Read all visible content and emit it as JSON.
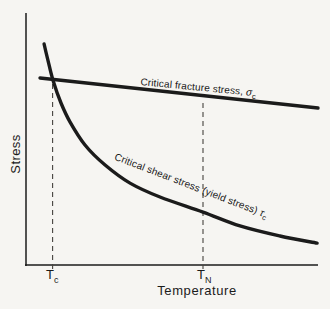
{
  "figure": {
    "background": "#f6f5f2",
    "ink": "#1b1b1b",
    "dash_color": "#45423e"
  },
  "chart_data": {
    "type": "line",
    "title": "",
    "xlabel": "Temperature",
    "ylabel": "Stress",
    "grid": false,
    "legend": "none (series labels drawn along curves)",
    "axes": "schematic, no numeric scale; point coordinates normalized 0-1 within plot box",
    "x_axis": {
      "label": "Temperature",
      "ticks": [
        {
          "main": "T",
          "sub": "c",
          "x": 0.091
        },
        {
          "main": "T",
          "sub": "N",
          "x": 0.606
        }
      ]
    },
    "y_axis": {
      "label": "Stress"
    },
    "series": [
      {
        "name": "Critical fracture stress, σc",
        "shape": "straight",
        "points": [
          [
            0.048,
            0.742
          ],
          [
            1.0,
            0.623
          ]
        ]
      },
      {
        "name": "Critical shear stress (yield stress) τc",
        "shape": "smooth",
        "points": [
          [
            0.062,
            0.877
          ],
          [
            0.075,
            0.813
          ],
          [
            0.092,
            0.734
          ],
          [
            0.12,
            0.643
          ],
          [
            0.151,
            0.567
          ],
          [
            0.202,
            0.476
          ],
          [
            0.271,
            0.397
          ],
          [
            0.356,
            0.325
          ],
          [
            0.459,
            0.27
          ],
          [
            0.606,
            0.21
          ],
          [
            0.733,
            0.155
          ],
          [
            0.87,
            0.115
          ],
          [
            0.997,
            0.087
          ]
        ]
      }
    ],
    "intersection": {
      "x": 0.091,
      "y": 0.734,
      "note": "curves cross at Tc"
    },
    "reference_lines": [
      {
        "label": "Tc",
        "x": 0.091,
        "y_top": 0.718,
        "style": "dashed"
      },
      {
        "label": "TN",
        "x": 0.606,
        "y_top": 0.643,
        "style": "dashed"
      }
    ],
    "annotations": [
      {
        "text": "Critical fracture stress, ",
        "symbol": "σ",
        "sub": "c",
        "placement": "along fracture line, rotated ~5°"
      },
      {
        "text": "Critical shear stress (yield stress) ",
        "symbol": "τ",
        "sub": "c",
        "placement": "along shear curve, rotated ~21°"
      }
    ]
  }
}
